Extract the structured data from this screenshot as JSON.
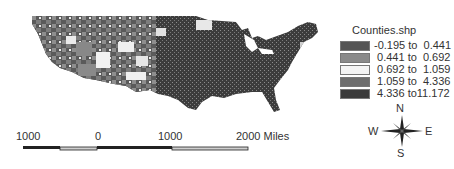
{
  "map": {
    "description": "Choropleth map of contiguous United States counties",
    "legend": {
      "title": "Counties.shp",
      "classes": [
        {
          "label": "-0.195 to  0.441",
          "color": "#555555"
        },
        {
          "label": " 0.441 to  0.692",
          "color": "#8a8a8a"
        },
        {
          "label": " 0.692 to  1.059",
          "color": "#f4f4f4"
        },
        {
          "label": " 1.059 to  4.336",
          "color": "#6e6e6e"
        },
        {
          "label": " 4.336 to11.172",
          "color": "#3a3a3a"
        }
      ]
    },
    "scale_bar": {
      "labels": [
        "1000",
        "0",
        "1000",
        "2000 Miles"
      ]
    },
    "compass": {
      "north": "N",
      "south": "S",
      "east": "E",
      "west": "W"
    }
  }
}
